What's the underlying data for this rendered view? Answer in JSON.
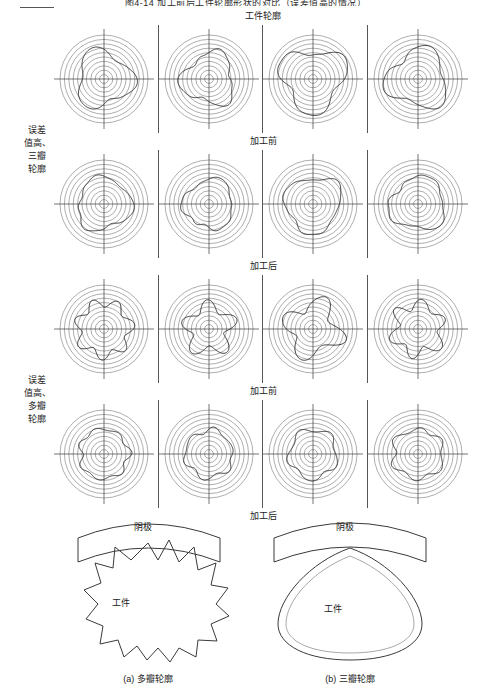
{
  "figure": {
    "title": "图4-14  加工前后工件轮廓形状的对比（误差值高的情况）",
    "caption_a": "(a) 多瓣轮廓",
    "caption_b": "(b) 三瓣轮廓"
  },
  "table": {
    "header_band": "工件轮廓",
    "groups": [
      {
        "label_lines": [
          "误差",
          "值高、",
          "三瓣",
          "轮廓"
        ],
        "rows": [
          {
            "band_after": "加工前",
            "cells": [
              "polar-3lobe-1",
              "polar-3lobe-2",
              "polar-3lobe-3",
              "polar-3lobe-4"
            ]
          },
          {
            "band_after": "加工后",
            "cells": [
              "polar-3lobe-5",
              "polar-3lobe-6",
              "polar-3lobe-7",
              "polar-3lobe-8"
            ]
          }
        ]
      },
      {
        "label_lines": [
          "误差",
          "值高、",
          "多瓣",
          "轮廓"
        ],
        "rows": [
          {
            "band_after": "加工前",
            "cells": [
              "polar-multilobe-1",
              "polar-multilobe-2",
              "polar-multilobe-3",
              "polar-multilobe-4"
            ]
          },
          {
            "band_after": "加工后",
            "cells": [
              "polar-multilobe-5",
              "polar-multilobe-6",
              "polar-multilobe-7",
              "polar-multilobe-8"
            ]
          }
        ]
      }
    ]
  },
  "schematic_left": {
    "cathode_label": "阴极",
    "workpiece_label": "工件",
    "caption": "(a) 多瓣轮廓"
  },
  "schematic_right": {
    "cathode_label": "阴极",
    "workpiece_label": "工件",
    "caption": "(b) 三瓣轮廓"
  },
  "chart_data": {
    "type": "line",
    "plot_kind": "polar-roundness-profile",
    "title": "工件轮廓",
    "grid": true,
    "grid_rings": 10,
    "axes": "cross-hair (0°/90°/180°/270°)",
    "ylabel": "",
    "xlabel": "",
    "panels": [
      {
        "group": "误差值高、三瓣轮廓",
        "stage": "加工前",
        "series": [
          {
            "name": "样件1",
            "lobes": 3,
            "mean_radius": 0.62,
            "amplitude": 0.13,
            "phase_deg": 95
          },
          {
            "name": "样件2",
            "lobes": 3,
            "mean_radius": 0.58,
            "amplitude": 0.11,
            "phase_deg": 140
          },
          {
            "name": "样件3",
            "lobes": 3,
            "mean_radius": 0.7,
            "amplitude": 0.16,
            "phase_deg": 60
          },
          {
            "name": "样件4",
            "lobes": 3,
            "mean_radius": 0.66,
            "amplitude": 0.14,
            "phase_deg": 20
          }
        ]
      },
      {
        "group": "误差值高、三瓣轮廓",
        "stage": "加工后",
        "series": [
          {
            "name": "样件1",
            "lobes": 3,
            "mean_radius": 0.6,
            "amplitude": 0.08,
            "phase_deg": 100
          },
          {
            "name": "样件2",
            "lobes": 3,
            "mean_radius": 0.56,
            "amplitude": 0.07,
            "phase_deg": 150
          },
          {
            "name": "样件3",
            "lobes": 3,
            "mean_radius": 0.63,
            "amplitude": 0.09,
            "phase_deg": 55
          },
          {
            "name": "样件4",
            "lobes": 3,
            "mean_radius": 0.61,
            "amplitude": 0.08,
            "phase_deg": 15
          }
        ]
      },
      {
        "group": "误差值高、多瓣轮廓",
        "stage": "加工前",
        "series": [
          {
            "name": "样件1",
            "lobes": 7,
            "mean_radius": 0.6,
            "amplitude": 0.1,
            "phase_deg": 30
          },
          {
            "name": "样件2",
            "lobes": 5,
            "mean_radius": 0.52,
            "amplitude": 0.14,
            "phase_deg": 70
          },
          {
            "name": "样件3",
            "lobes": 4,
            "mean_radius": 0.58,
            "amplitude": 0.17,
            "phase_deg": 110
          },
          {
            "name": "样件4",
            "lobes": 6,
            "mean_radius": 0.56,
            "amplitude": 0.12,
            "phase_deg": 10
          }
        ]
      },
      {
        "group": "误差值高、多瓣轮廓",
        "stage": "加工后",
        "series": [
          {
            "name": "样件1",
            "lobes": 7,
            "mean_radius": 0.56,
            "amplitude": 0.05,
            "phase_deg": 35
          },
          {
            "name": "样件2",
            "lobes": 6,
            "mean_radius": 0.54,
            "amplitude": 0.05,
            "phase_deg": 75
          },
          {
            "name": "样件3",
            "lobes": 5,
            "mean_radius": 0.55,
            "amplitude": 0.06,
            "phase_deg": 115
          },
          {
            "name": "样件4",
            "lobes": 6,
            "mean_radius": 0.57,
            "amplitude": 0.05,
            "phase_deg": 5
          }
        ]
      }
    ]
  },
  "colors": {
    "line": "#3a3a3a",
    "grid": "#6b6b6b",
    "border": "#555555",
    "text": "#1a1a1a",
    "background": "#ffffff"
  }
}
